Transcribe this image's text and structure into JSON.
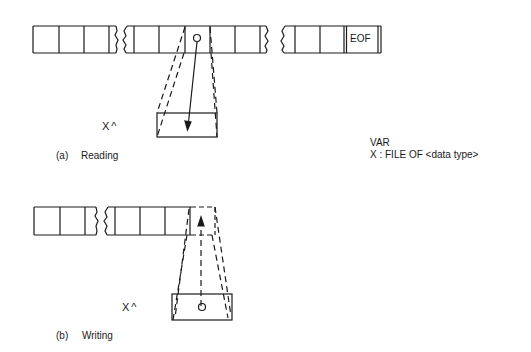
{
  "diagram": {
    "reading": {
      "caption_letter": "(a)",
      "caption_text": "Reading",
      "buffer_label": "X^",
      "eof_label": "EOF"
    },
    "writing": {
      "caption_letter": "(b)",
      "caption_text": "Writing",
      "buffer_label": "X^"
    },
    "declaration": {
      "line1": "VAR",
      "line2": "X : FILE OF <data type>"
    },
    "colors": {
      "ink": "#1a1a1a",
      "background": "#ffffff"
    }
  }
}
